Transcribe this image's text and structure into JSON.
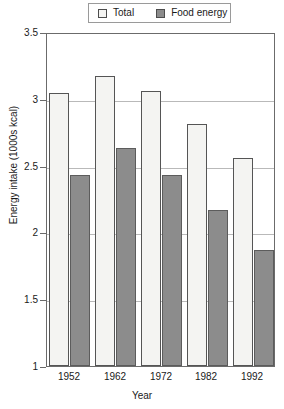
{
  "legend": {
    "position": "top-center",
    "entries": [
      {
        "label": "Total",
        "swatch": "total-swatch",
        "color": "#f4f4f2"
      },
      {
        "label": "Food energy",
        "swatch": "food-energy-swatch",
        "color": "#8c8c8c"
      }
    ]
  },
  "chart_data": {
    "type": "bar",
    "title": "",
    "subtitle": "",
    "xlabel": "Year",
    "ylabel": "Energy intake (1000s kcal)",
    "categories": [
      "1952",
      "1962",
      "1972",
      "1982",
      "1992"
    ],
    "series": [
      {
        "name": "Total",
        "color": "#f4f4f2",
        "values": [
          3.04,
          3.17,
          3.06,
          2.81,
          2.56
        ]
      },
      {
        "name": "Food energy",
        "color": "#8c8c8c",
        "values": [
          2.43,
          2.63,
          2.43,
          2.17,
          1.87
        ]
      }
    ],
    "ylim": [
      1,
      3.5
    ],
    "yticks": [
      1,
      1.5,
      2,
      2.5,
      3,
      3.5
    ],
    "ytick_labels": [
      "1",
      "1.5",
      "2",
      "2.5",
      "3",
      "3.5"
    ],
    "gridlines": [
      1.5,
      2,
      2.5,
      3
    ],
    "grid": true,
    "legend_position": "top-center"
  }
}
